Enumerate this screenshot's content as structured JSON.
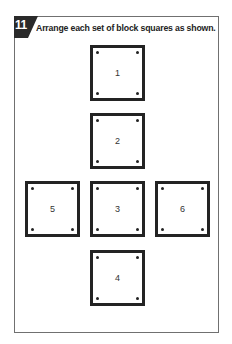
{
  "exercise": {
    "number": "11",
    "instruction": "Arrange each set of block squares as shown."
  },
  "blocks": [
    {
      "label": "1",
      "position": "top"
    },
    {
      "label": "2",
      "position": "upper-middle"
    },
    {
      "label": "3",
      "position": "center"
    },
    {
      "label": "4",
      "position": "bottom"
    },
    {
      "label": "5",
      "position": "left"
    },
    {
      "label": "6",
      "position": "right"
    }
  ],
  "colors": {
    "badge": "#2a2a2a",
    "block_border": "#232323",
    "frame_border": "#707070"
  }
}
